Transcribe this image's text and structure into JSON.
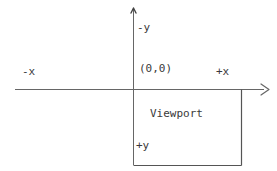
{
  "diagram": {
    "type": "coordinate-axes",
    "colors": {
      "line": "#666666",
      "viewport_border": "#555555",
      "text": "#3a3a3a",
      "background": "#ffffff"
    },
    "labels": {
      "negative_y": "-y",
      "negative_x": "-x",
      "origin": "(0,0)",
      "positive_x": "+x",
      "viewport": "Viewport",
      "positive_y": "+y"
    },
    "geometry": {
      "origin_x": 133,
      "origin_y": 89,
      "x_axis_start": 15,
      "x_axis_end": 270,
      "y_axis_start": 8,
      "y_axis_end": 165,
      "viewport_right": 241,
      "viewport_bottom": 165
    }
  }
}
